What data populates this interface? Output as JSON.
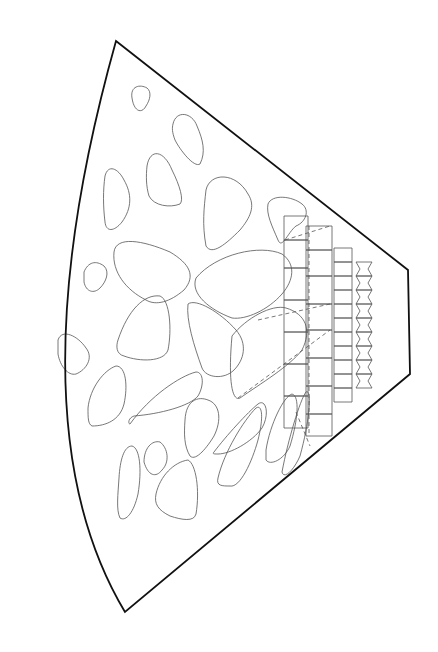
{
  "diagram": {
    "title": "",
    "outline": {
      "path": "M116 41 L408 270 L410 374 L125 612 Q10 420 116 41 Z",
      "stroke": "#111111"
    },
    "blobs": [
      "M132 98 C130 86 140 84 147 88 C152 92 150 100 146 106 C142 114 134 112 132 98 Z",
      "M173 124 C176 110 192 112 197 126 C203 140 206 152 200 164 C194 168 180 150 175 140 C172 132 172 128 173 124 Z",
      "M147 166 C150 148 164 150 172 170 C180 186 184 200 180 204 C170 208 154 206 149 196 C146 186 146 176 147 166 Z",
      "M105 176 C108 164 118 168 124 180 C132 194 132 208 122 222 C114 232 106 232 105 222 C103 206 103 190 105 176 Z",
      "M206 190 C210 172 236 172 248 194 C256 206 250 218 240 230 C226 244 212 256 206 246 C202 224 204 208 206 190 Z",
      "M268 204 C272 194 292 196 302 204 C310 210 306 222 296 226 C288 232 282 250 278 240 C272 226 266 214 268 204 Z",
      "M114 252 C116 236 142 240 170 252 C190 264 196 276 184 290 C170 302 156 306 146 300 C126 290 112 272 114 252 Z",
      "M84 272 C88 262 96 260 104 266 C110 272 106 282 100 288 C94 294 86 292 84 282 Z",
      "M196 278 C216 254 260 244 282 254 C296 264 294 280 282 294 C268 310 246 320 232 318 C210 310 190 294 196 278 Z",
      "M118 340 C128 310 144 294 160 296 C170 300 172 330 168 350 C164 362 140 362 124 356 C116 354 116 346 118 340 Z",
      "M188 304 C196 298 220 312 236 330 C248 344 244 360 234 370 C224 380 206 378 202 368 C194 346 186 320 188 304 Z",
      "M58 340 C62 328 78 336 86 348 C94 358 86 370 76 374 C68 376 60 366 58 354 Z",
      "M232 336 C246 318 272 304 286 308 C306 314 312 330 302 350 C290 366 260 384 240 398 C232 402 228 380 232 336 Z",
      "M130 424 C150 396 180 376 196 372 C204 372 204 386 198 396 C190 406 160 414 134 416 C128 418 128 424 130 424 Z",
      "M88 408 C90 388 104 370 116 366 C126 366 128 386 124 404 C120 420 106 426 92 426 C88 424 88 418 88 408 Z",
      "M185 420 C186 400 198 396 208 400 C220 404 222 420 214 436 C208 446 196 462 190 456 C184 446 184 434 185 420 Z",
      "M214 452 C226 436 248 412 258 404 C266 398 270 414 262 428 C252 442 230 454 218 454 C214 454 212 454 214 452 Z",
      "M218 478 C224 452 244 420 256 408 C262 404 264 416 258 440 C252 462 240 488 230 486 C222 486 216 486 218 478 Z",
      "M266 450 C270 424 284 396 292 394 C300 396 298 420 290 446 C284 460 270 466 266 460 Z",
      "M282 472 C288 440 300 400 306 392 C312 388 310 420 300 456 C294 470 284 480 282 472 Z",
      "M119 478 C120 460 124 446 132 446 C140 448 142 470 138 494 C134 512 126 522 120 518 C116 510 118 494 119 478 Z",
      "M144 462 C144 448 152 440 160 442 C168 448 170 462 162 470 C156 478 148 476 144 462 Z",
      "M156 494 C160 476 174 462 188 460 C196 464 200 490 196 514 C194 522 182 520 170 516 C158 510 154 504 156 494 Z"
    ],
    "cell_columns": [
      {
        "x": 284,
        "w": 24,
        "ys": [
          216,
          240,
          268,
          300,
          332,
          364,
          396,
          428
        ],
        "dashed": false
      },
      {
        "x": 306,
        "w": 26,
        "ys": [
          226,
          250,
          276,
          304,
          330,
          358,
          386,
          414,
          436
        ],
        "dashed": true
      },
      {
        "x": 334,
        "w": 18,
        "ys": [
          248,
          262,
          276,
          290,
          304,
          318,
          332,
          346,
          360,
          374,
          388,
          402
        ],
        "dashed": false
      },
      {
        "x": 356,
        "w": 16,
        "ys": [
          262,
          276,
          290,
          304,
          318,
          332,
          346,
          360,
          374,
          388
        ],
        "dashed": false,
        "zigzag": true
      }
    ],
    "dashed_lines": [
      "M285 240 L330 226",
      "M258 320 L330 304",
      "M238 398 L330 330",
      "M296 412 L310 446"
    ]
  }
}
